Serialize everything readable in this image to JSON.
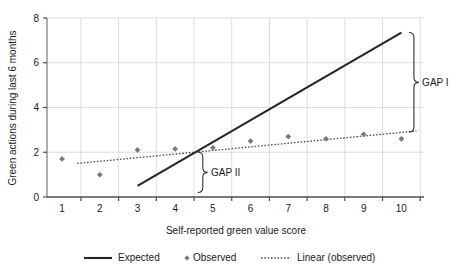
{
  "chart_data": {
    "type": "scatter",
    "title": "",
    "xlabel": "Self-reported green value score",
    "ylabel": "Green actions during last 6 months",
    "xlim": [
      0.6,
      10.6
    ],
    "ylim": [
      0,
      8
    ],
    "xticks": [
      1,
      2,
      3,
      4,
      5,
      6,
      7,
      8,
      9,
      10
    ],
    "yticks": [
      0,
      2,
      4,
      6,
      8
    ],
    "grid": true,
    "legend_position": "bottom",
    "series": [
      {
        "name": "Expected",
        "type": "line",
        "style": "solid",
        "color": "#262626",
        "x": [
          3,
          10
        ],
        "values": [
          0.5,
          7.35
        ]
      },
      {
        "name": "Observed",
        "type": "scatter",
        "marker": "diamond",
        "color": "#7a7a7a",
        "x": [
          1,
          2,
          3,
          4,
          5,
          6,
          7,
          8,
          9,
          10
        ],
        "values": [
          1.7,
          1.0,
          2.1,
          2.15,
          2.2,
          2.5,
          2.7,
          2.6,
          2.8,
          2.6
        ]
      },
      {
        "name": "Linear (observed)",
        "type": "line",
        "style": "dotted",
        "color": "#4d4d4d",
        "x": [
          1.4,
          10.4
        ],
        "values": [
          1.5,
          2.95
        ]
      }
    ],
    "annotations": [
      {
        "label": "GAP I",
        "bracket_x": 10.2,
        "bracket_y_top": 7.35,
        "bracket_y_bottom": 2.9,
        "label_x": 10.55,
        "label_y": 5.1
      },
      {
        "label": "GAP II",
        "bracket_x": 4.6,
        "bracket_y_top": 2.0,
        "bracket_y_bottom": 0.2,
        "label_x": 4.95,
        "label_y": 1.1
      }
    ]
  },
  "axes": {
    "xlabel": "Self-reported green value score",
    "ylabel": "Green actions during last 6 months",
    "xticks": [
      "1",
      "2",
      "3",
      "4",
      "5",
      "6",
      "7",
      "8",
      "9",
      "10"
    ],
    "yticks": [
      "0",
      "2",
      "4",
      "6",
      "8"
    ]
  },
  "annotations": {
    "gap1": "GAP I",
    "gap2": "GAP II"
  },
  "legend": {
    "items": [
      {
        "label": "Expected",
        "marker": "solid-line"
      },
      {
        "label": "Observed",
        "marker": "diamond-point"
      },
      {
        "label": "Linear (observed)",
        "marker": "dotted-line"
      }
    ]
  }
}
